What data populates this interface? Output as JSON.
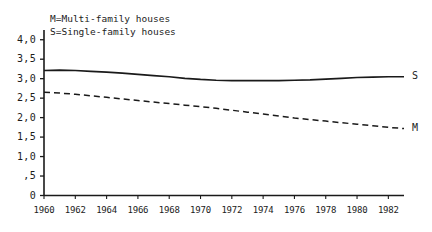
{
  "chart_data": {
    "type": "line",
    "title": "",
    "subtitle": "",
    "xlabel": "",
    "ylabel": "",
    "grid": false,
    "legend_position": "top-left-inside",
    "xlim": [
      1960,
      1983
    ],
    "ylim": [
      0,
      4.25
    ],
    "x_ticks": [
      "1960",
      "1962",
      "1964",
      "1966",
      "1968",
      "1970",
      "1972",
      "1974",
      "1976",
      "1978",
      "1980",
      "1982"
    ],
    "x_tick_values": [
      1960,
      1962,
      1964,
      1966,
      1968,
      1970,
      1972,
      1974,
      1976,
      1978,
      1980,
      1982
    ],
    "y_ticks": [
      "0",
      ",5",
      "1,0",
      "1,5",
      "2,0",
      "2,5",
      "3,0",
      "3,5",
      "4,0"
    ],
    "y_tick_values": [
      0,
      0.5,
      1.0,
      1.5,
      2.0,
      2.5,
      3.0,
      3.5,
      4.0
    ],
    "annotations": [
      {
        "text": "M=Multi-family houses",
        "role": "legend-line-1"
      },
      {
        "text": "S=Single-family houses",
        "role": "legend-line-2"
      }
    ],
    "end_labels": [
      {
        "text": "S",
        "series": "Single-family houses",
        "x": 1983,
        "y": 3.05
      },
      {
        "text": "M",
        "series": "Multi-family houses",
        "x": 1983,
        "y": 1.72
      }
    ],
    "x": [
      1960,
      1961,
      1962,
      1963,
      1964,
      1965,
      1966,
      1967,
      1968,
      1969,
      1970,
      1971,
      1972,
      1973,
      1974,
      1975,
      1976,
      1977,
      1978,
      1979,
      1980,
      1981,
      1982,
      1983
    ],
    "series": [
      {
        "name": "Single-family houses",
        "key": "S",
        "style": "solid",
        "color": "#1a1a1a",
        "values": [
          3.21,
          3.22,
          3.21,
          3.19,
          3.17,
          3.14,
          3.11,
          3.08,
          3.05,
          3.01,
          2.98,
          2.96,
          2.95,
          2.95,
          2.95,
          2.95,
          2.96,
          2.97,
          2.99,
          3.01,
          3.03,
          3.04,
          3.05,
          3.05
        ]
      },
      {
        "name": "Multi-family houses",
        "key": "M",
        "style": "dashed",
        "color": "#1a1a1a",
        "values": [
          2.65,
          2.63,
          2.6,
          2.56,
          2.52,
          2.48,
          2.44,
          2.4,
          2.36,
          2.32,
          2.28,
          2.24,
          2.19,
          2.14,
          2.09,
          2.04,
          1.99,
          1.95,
          1.91,
          1.87,
          1.83,
          1.79,
          1.75,
          1.72
        ]
      }
    ]
  },
  "axes": {
    "y_axis_name": "value-axis",
    "x_axis_name": "year-axis",
    "accent_color": "#1a1a1a"
  }
}
